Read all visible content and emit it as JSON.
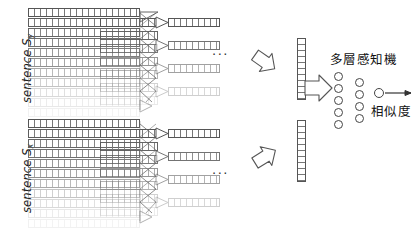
{
  "figure": {
    "type": "neural-network-architecture-diagram",
    "background_color": "#ffffff",
    "line_color": "#555555"
  },
  "labels": {
    "sentence_y": "sentence S",
    "sentence_y_sub": "y",
    "sentence_x": "sentence S",
    "sentence_x_sub": "x",
    "mlp": "多層感知機",
    "similarity": "相似度",
    "ellipsis_top": "...",
    "ellipsis_bottom": "..."
  },
  "branches": [
    {
      "name": "top-branch",
      "label": "sentence S_y",
      "input_rows": 11,
      "mid_rows": 7,
      "out_rows": 4,
      "vector_cells": 11
    },
    {
      "name": "bottom-branch",
      "label": "sentence S_x",
      "input_rows": 11,
      "mid_rows": 7,
      "out_rows": 4,
      "vector_cells": 11
    }
  ],
  "mlp_network": {
    "layer1_nodes": 5,
    "layer2_nodes": 4,
    "output_nodes": 1,
    "output_label": "相似度"
  },
  "icons": {
    "block_arrow_down_right": "block-arrow-icon",
    "block_arrow_up_right": "block-arrow-icon",
    "block_arrow_right": "block-arrow-icon",
    "triangle_merge": "triangle-arrow-icon",
    "output_arrow": "line-arrow-icon"
  }
}
